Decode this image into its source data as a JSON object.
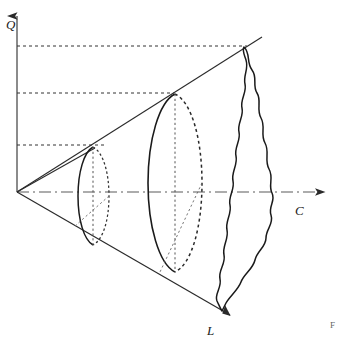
{
  "figure": {
    "background_color": "#ffffff",
    "stroke_color": "#1a1a1a",
    "axis_color": "#4a4a4a",
    "width": 339,
    "height": 338
  },
  "axes": {
    "vertical": {
      "label": "Q",
      "name": "quality-axis",
      "label_x": 10,
      "label_y": 25,
      "x1": 17,
      "y1": 192,
      "x2": 17,
      "y2": 12
    },
    "horizontal": {
      "label": "C",
      "name": "cost-axis",
      "label_x": 298,
      "label_y": 213,
      "x1": 17,
      "y1": 192,
      "x2": 330,
      "y2": 192,
      "style": "dash-dot"
    },
    "diagonal": {
      "label": "L",
      "name": "lead-time-axis",
      "label_x": 210,
      "label_y": 334,
      "x1": 17,
      "y1": 192,
      "x2": 237,
      "y2": 320,
      "style": "solid"
    }
  },
  "cone": {
    "upper_generator": {
      "x1": 17,
      "y1": 192,
      "x2": 258,
      "y2": 40
    },
    "short_generator": {
      "x1": 17,
      "y1": 192,
      "x2": 103,
      "y2": 146
    },
    "apex": {
      "x": 17,
      "y": 192
    }
  },
  "guides": {
    "horizontal_dashed": [
      {
        "y": 46,
        "x_start": 17,
        "x_end": 247,
        "name": "guide-line-top"
      },
      {
        "y": 93,
        "x_start": 17,
        "x_end": 172,
        "name": "guide-line-middle"
      },
      {
        "y": 145,
        "x_start": 17,
        "x_end": 104,
        "name": "guide-line-bottom"
      }
    ]
  },
  "sections": [
    {
      "name": "section-small",
      "cx": 93,
      "cy": 196,
      "rx": 15,
      "ry": 49,
      "top_x": 93,
      "top_y": 147,
      "bottom_x": 93,
      "bottom_y": 245,
      "front_x": 78,
      "back_x": 108
    },
    {
      "name": "section-medium",
      "cx": 175,
      "cy": 183,
      "rx": 27,
      "ry": 89,
      "top_x": 175,
      "top_y": 94,
      "bottom_x": 175,
      "bottom_y": 272,
      "front_x": 148,
      "back_x": 202
    }
  ],
  "wavy_section": {
    "name": "section-irregular-wavy",
    "top": {
      "x": 244,
      "y": 47
    },
    "bottom": {
      "x": 222,
      "y": 311
    },
    "left_extent": 216,
    "right_extent": 291,
    "description": "irregular wavy closed outline representing a distorted cross-section"
  },
  "edge_text": {
    "fragment": "F t"
  }
}
